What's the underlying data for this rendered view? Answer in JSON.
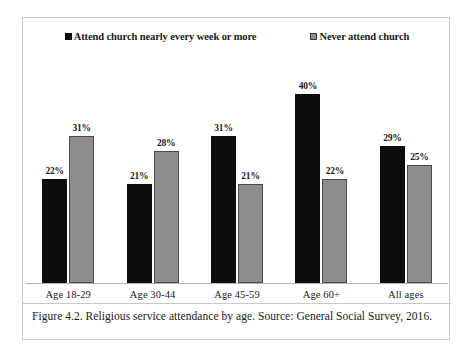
{
  "figure": {
    "caption": "Figure 4.2. Religious service attendance by age. Source: General Social Survey, 2016."
  },
  "chart_data": {
    "type": "bar",
    "title": "",
    "subtitle": "",
    "xlabel": "",
    "ylabel": "",
    "ylim": [
      0,
      48
    ],
    "grid": false,
    "legend_position": "top-center",
    "value_labels": true,
    "value_label_suffix": "%",
    "categories": [
      "Age 18-29",
      "Age 30-44",
      "Age 45-59",
      "Age 60+",
      "All ages"
    ],
    "series": [
      {
        "name": "Attend church nearly every week or more",
        "color": "#0d0d0d",
        "values": [
          22,
          21,
          31,
          40,
          29
        ],
        "labels": [
          "22%",
          "21%",
          "31%",
          "40%",
          "29%"
        ]
      },
      {
        "name": "Never attend church",
        "color": "#8d8d8d",
        "values": [
          31,
          28,
          21,
          22,
          25
        ],
        "labels": [
          "31%",
          "28%",
          "21%",
          "22%",
          "25%"
        ]
      }
    ]
  },
  "colors": {
    "series_dark": "#0d0d0d",
    "series_light": "#8d8d8d",
    "frame": "#c9c9c9",
    "axis": "#b5b5b5",
    "background": "#ffffff"
  }
}
